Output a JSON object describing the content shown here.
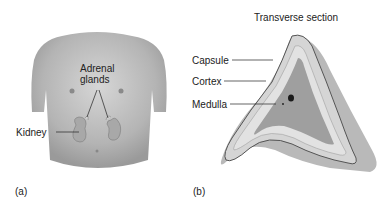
{
  "panel_a": {
    "label": "(a)",
    "labels": {
      "adrenal_line1": "Adrenal",
      "adrenal_line2": "glands",
      "kidney": "Kidney"
    }
  },
  "panel_b": {
    "label": "(b)",
    "title": "Transverse section",
    "labels": {
      "capsule": "Capsule",
      "cortex": "Cortex",
      "medulla": "Medulla"
    }
  }
}
